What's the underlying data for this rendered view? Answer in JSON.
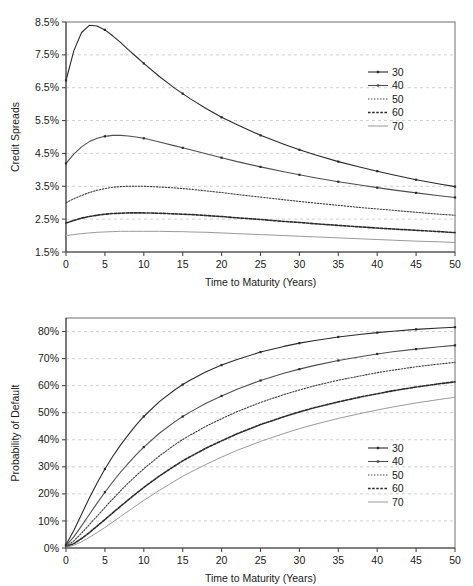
{
  "figure": {
    "panels": [
      "credit-spreads",
      "probability-of-default"
    ]
  },
  "chart_data": [
    {
      "id": "credit-spreads",
      "type": "line",
      "title": "",
      "xlabel": "Time to Maturity (Years)",
      "ylabel": "Credit Spreads",
      "xlim": [
        0,
        50
      ],
      "ylim": [
        1.5,
        8.5
      ],
      "xticks": [
        0,
        5,
        10,
        15,
        20,
        25,
        30,
        35,
        40,
        45,
        50
      ],
      "xticklabels": [
        "0",
        "5",
        "10",
        "15",
        "20",
        "25",
        "30",
        "35",
        "40",
        "45",
        "50"
      ],
      "yticks": [
        1.5,
        2.5,
        3.5,
        4.5,
        5.5,
        6.5,
        7.5,
        8.5
      ],
      "yticklabels": [
        "1.5%",
        "2.5%",
        "3.5%",
        "4.5%",
        "5.5%",
        "6.5%",
        "7.5%",
        "8.5%"
      ],
      "grid": true,
      "grid_axis": "y",
      "legend_position": "upper-right-inside",
      "x": [
        0,
        1,
        2,
        3,
        4,
        5,
        6,
        7,
        8,
        9,
        10,
        12,
        14,
        15,
        16,
        18,
        20,
        22,
        25,
        28,
        30,
        32,
        35,
        38,
        40,
        42,
        45,
        48,
        50
      ],
      "series": [
        {
          "name": "30",
          "label": "30",
          "style": "solid-marker",
          "color": "#2b2b2b",
          "values": [
            6.72,
            7.62,
            8.18,
            8.4,
            8.38,
            8.26,
            8.08,
            7.88,
            7.66,
            7.45,
            7.24,
            6.84,
            6.48,
            6.32,
            6.16,
            5.87,
            5.6,
            5.37,
            5.05,
            4.78,
            4.61,
            4.46,
            4.25,
            4.07,
            3.96,
            3.85,
            3.7,
            3.57,
            3.49
          ]
        },
        {
          "name": "40",
          "label": "40",
          "style": "solid-marker",
          "color": "#4f4f4f",
          "values": [
            4.2,
            4.48,
            4.7,
            4.86,
            4.96,
            5.02,
            5.05,
            5.05,
            5.03,
            5.0,
            4.96,
            4.85,
            4.73,
            4.67,
            4.61,
            4.49,
            4.37,
            4.25,
            4.09,
            3.94,
            3.85,
            3.76,
            3.64,
            3.53,
            3.46,
            3.39,
            3.3,
            3.21,
            3.16
          ]
        },
        {
          "name": "50",
          "label": "50",
          "style": "dotted",
          "color": "#3a3a3a",
          "values": [
            3.0,
            3.12,
            3.22,
            3.31,
            3.38,
            3.43,
            3.47,
            3.49,
            3.5,
            3.5,
            3.5,
            3.48,
            3.45,
            3.43,
            3.41,
            3.36,
            3.31,
            3.25,
            3.17,
            3.09,
            3.04,
            2.99,
            2.92,
            2.85,
            2.81,
            2.77,
            2.71,
            2.65,
            2.62
          ]
        },
        {
          "name": "60",
          "label": "60",
          "style": "dashed",
          "color": "#2b2b2b",
          "values": [
            2.38,
            2.46,
            2.53,
            2.58,
            2.62,
            2.65,
            2.67,
            2.68,
            2.69,
            2.69,
            2.69,
            2.68,
            2.66,
            2.65,
            2.64,
            2.61,
            2.58,
            2.54,
            2.49,
            2.43,
            2.4,
            2.36,
            2.31,
            2.26,
            2.23,
            2.2,
            2.16,
            2.12,
            2.09
          ]
        },
        {
          "name": "70",
          "label": "70",
          "style": "solid-light",
          "color": "#9a9a9a",
          "values": [
            2.0,
            2.03,
            2.06,
            2.08,
            2.1,
            2.11,
            2.12,
            2.13,
            2.13,
            2.13,
            2.13,
            2.13,
            2.12,
            2.12,
            2.11,
            2.1,
            2.08,
            2.06,
            2.03,
            2.0,
            1.98,
            1.96,
            1.93,
            1.9,
            1.88,
            1.86,
            1.83,
            1.81,
            1.79
          ]
        }
      ],
      "legend": [
        {
          "label": "30",
          "style": "solid-marker",
          "color": "#2b2b2b"
        },
        {
          "label": "40",
          "style": "solid-marker",
          "color": "#4f4f4f"
        },
        {
          "label": "50",
          "style": "dotted",
          "color": "#3a3a3a"
        },
        {
          "label": "60",
          "style": "dashed",
          "color": "#2b2b2b"
        },
        {
          "label": "70",
          "style": "solid-light",
          "color": "#9a9a9a"
        }
      ]
    },
    {
      "id": "probability-of-default",
      "type": "line",
      "title": "",
      "xlabel": "Time to Maturity (Years)",
      "ylabel": "Probability of Default",
      "xlim": [
        0,
        50
      ],
      "ylim": [
        0,
        85
      ],
      "xticks": [
        0,
        5,
        10,
        15,
        20,
        25,
        30,
        35,
        40,
        45,
        50
      ],
      "xticklabels": [
        "0",
        "5",
        "10",
        "15",
        "20",
        "25",
        "30",
        "35",
        "40",
        "45",
        "50"
      ],
      "yticks": [
        0,
        10,
        20,
        30,
        40,
        50,
        60,
        70,
        80
      ],
      "yticklabels": [
        "0%",
        "10%",
        "20%",
        "30%",
        "40%",
        "50%",
        "60%",
        "70%",
        "80%"
      ],
      "grid": true,
      "grid_axis": "y",
      "legend_position": "lower-right-inside",
      "x": [
        0,
        1,
        2,
        3,
        4,
        5,
        6,
        7,
        8,
        9,
        10,
        12,
        14,
        15,
        16,
        18,
        20,
        22,
        25,
        28,
        30,
        32,
        35,
        38,
        40,
        42,
        45,
        48,
        50
      ],
      "series": [
        {
          "name": "30",
          "label": "30",
          "style": "solid-marker",
          "color": "#2b2b2b",
          "values": [
            1.2,
            6.5,
            12.5,
            18.5,
            24.0,
            29.2,
            33.8,
            38.0,
            41.8,
            45.4,
            48.6,
            54.1,
            58.5,
            60.4,
            62.1,
            65.1,
            67.6,
            69.7,
            72.4,
            74.5,
            75.7,
            76.7,
            78.0,
            79.0,
            79.6,
            80.1,
            80.8,
            81.3,
            81.6
          ]
        },
        {
          "name": "40",
          "label": "40",
          "style": "solid-marker",
          "color": "#4f4f4f",
          "values": [
            0.9,
            4.1,
            8.2,
            12.4,
            16.6,
            20.6,
            24.4,
            28.0,
            31.3,
            34.4,
            37.3,
            42.4,
            46.7,
            48.6,
            50.3,
            53.5,
            56.2,
            58.7,
            61.9,
            64.6,
            66.1,
            67.5,
            69.3,
            70.8,
            71.7,
            72.5,
            73.5,
            74.4,
            74.9
          ]
        },
        {
          "name": "50",
          "label": "50",
          "style": "dotted",
          "color": "#3a3a3a",
          "values": [
            0.6,
            2.6,
            5.5,
            8.6,
            11.8,
            15.0,
            18.1,
            21.1,
            24.0,
            26.7,
            29.3,
            34.0,
            38.2,
            40.1,
            41.8,
            45.0,
            47.8,
            50.4,
            53.8,
            56.7,
            58.4,
            60.0,
            62.0,
            63.7,
            64.8,
            65.7,
            67.0,
            68.0,
            68.6
          ]
        },
        {
          "name": "60",
          "label": "60",
          "style": "dashed",
          "color": "#2b2b2b",
          "values": [
            0.4,
            1.6,
            3.5,
            5.7,
            8.1,
            10.5,
            13.0,
            15.4,
            17.8,
            20.1,
            22.4,
            26.6,
            30.4,
            32.2,
            33.8,
            36.9,
            39.6,
            42.2,
            45.6,
            48.5,
            50.3,
            51.9,
            54.0,
            55.9,
            57.0,
            58.1,
            59.5,
            60.7,
            61.4
          ]
        },
        {
          "name": "70",
          "label": "70",
          "style": "solid-light",
          "color": "#9a9a9a",
          "values": [
            0.3,
            1.0,
            2.3,
            3.9,
            5.7,
            7.6,
            9.6,
            11.6,
            13.6,
            15.6,
            17.6,
            21.3,
            24.8,
            26.5,
            28.0,
            30.9,
            33.6,
            36.1,
            39.4,
            42.3,
            44.1,
            45.7,
            47.9,
            49.8,
            51.0,
            52.1,
            53.6,
            54.9,
            55.7
          ]
        }
      ],
      "legend": [
        {
          "label": "30",
          "style": "solid-marker",
          "color": "#2b2b2b"
        },
        {
          "label": "40",
          "style": "solid-marker",
          "color": "#4f4f4f"
        },
        {
          "label": "50",
          "style": "dotted",
          "color": "#3a3a3a"
        },
        {
          "label": "60",
          "style": "dashed",
          "color": "#2b2b2b"
        },
        {
          "label": "70",
          "style": "solid-light",
          "color": "#9a9a9a"
        }
      ]
    }
  ],
  "colors": {
    "frame": "#6e6e6e",
    "grid": "#bdbdbd",
    "axis": "#4a4a4a",
    "text": "#1a1a1a",
    "background": "#ffffff"
  }
}
